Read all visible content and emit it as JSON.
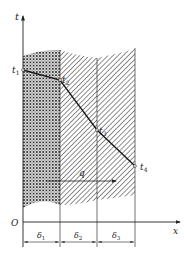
{
  "diagram": {
    "type": "multilayer-wall-temperature-profile",
    "axes": {
      "y_label": "t",
      "x_label": "x",
      "origin_label": "O"
    },
    "layers": [
      {
        "name": "layer-1",
        "thickness_label": "δ1",
        "pattern": "crosshatch"
      },
      {
        "name": "layer-2",
        "thickness_label": "δ2",
        "pattern": "diagonal-hatch"
      },
      {
        "name": "layer-3",
        "thickness_label": "δ3",
        "pattern": "diagonal-hatch-reverse"
      }
    ],
    "temperatures": [
      {
        "label": "t1",
        "position": "left surface of layer 1"
      },
      {
        "label": "t2",
        "position": "interface 1-2"
      },
      {
        "label": "t3",
        "position": "interface 2-3"
      },
      {
        "label": "t4",
        "position": "right surface of layer 3"
      }
    ],
    "heat_flux": {
      "label": "q",
      "direction": "positive x"
    },
    "colors": {
      "line": "#222222",
      "hatch": "#333333",
      "background": "#ffffff"
    }
  },
  "labels": {
    "t_axis": "t",
    "x_axis": "x",
    "origin": "O",
    "t1": "t",
    "t1_sub": "1",
    "t2": "t",
    "t2_sub": "2",
    "t3": "t",
    "t3_sub": "3",
    "t4": "t",
    "t4_sub": "4",
    "q": "q",
    "d1": "δ",
    "d1_sub": "1",
    "d2": "δ",
    "d2_sub": "2",
    "d3": "δ",
    "d3_sub": "3"
  }
}
